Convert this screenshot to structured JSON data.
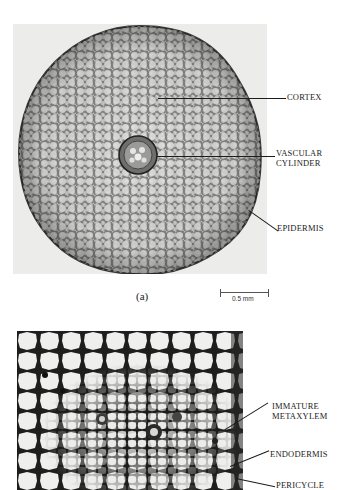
{
  "figure": {
    "panel_a": {
      "caption": "(a)",
      "image_description": "Light micrograph of a root cross-section: circular section with cortex of rounded parenchyma cells and a small central vascular cylinder",
      "labels": [
        {
          "text": "CORTEX"
        },
        {
          "text": "VASCULAR\nCYLINDER",
          "lines": [
            "VASCULAR",
            "CYLINDER"
          ]
        },
        {
          "text": "EPIDERMIS"
        }
      ],
      "scale_bar": {
        "label": "0.5 mm"
      }
    },
    "panel_b": {
      "image_description": "Higher magnification micrograph of the vascular cylinder region showing polygonal cells with dark walls",
      "labels": [
        {
          "text": "IMMATURE\nMETAXYLEM",
          "lines": [
            "IMMATURE",
            "METAXYLEM"
          ]
        },
        {
          "text": "ENDODERMIS"
        },
        {
          "text": "PERICYCLE"
        }
      ]
    }
  }
}
